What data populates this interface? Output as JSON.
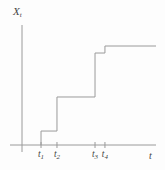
{
  "figure": {
    "background": "#fdfdfd",
    "line_color": "#9a9a9a",
    "text_color": "#454545"
  },
  "chart_data": {
    "type": "step",
    "title": "",
    "ylabel_base": "X",
    "ylabel_sub": "t",
    "xlabel": "t",
    "xlim": [
      0,
      1.0
    ],
    "ylim": [
      0,
      1.21
    ],
    "grid": false,
    "legend": false,
    "x_ticks": [
      {
        "base": "t",
        "sub": "1",
        "pos": 0.142
      },
      {
        "base": "t",
        "sub": "2",
        "pos": 0.261
      },
      {
        "base": "t",
        "sub": "3",
        "pos": 0.545
      },
      {
        "base": "t",
        "sub": "4",
        "pos": 0.619
      }
    ],
    "steps": [
      {
        "x_start": 0.142,
        "x_end": 0.261,
        "level": 0.141
      },
      {
        "x_start": 0.261,
        "x_end": 0.545,
        "level": 0.485
      },
      {
        "x_start": 0.545,
        "x_end": 0.619,
        "level": 0.929
      },
      {
        "x_start": 0.619,
        "x_end": 1.0,
        "level": 1.0
      }
    ]
  }
}
